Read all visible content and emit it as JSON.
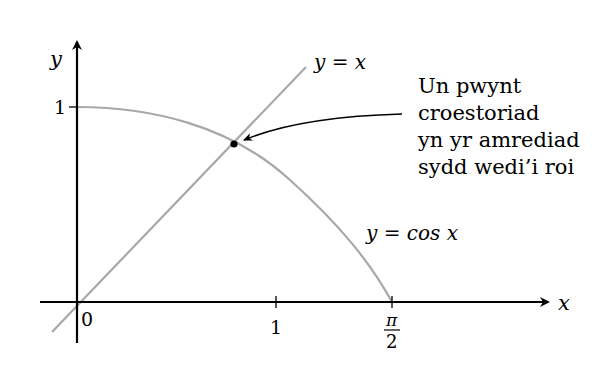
{
  "axes": {
    "x_label": "x",
    "y_label": "y",
    "origin_label": "0",
    "x_tick_1": "1",
    "x_tick_pi_num": "π",
    "x_tick_pi_den": "2",
    "y_tick_1": "1"
  },
  "curves": {
    "line_label": "y = x",
    "cos_label": "y = cos x"
  },
  "annotation": {
    "lines": [
      "Un pwynt",
      "croestoriad",
      "yn yr amrediad",
      "sydd wedi’i roi"
    ]
  },
  "colors": {
    "axis": "#000000",
    "curve": "#a8a8a8",
    "point": "#000000"
  }
}
